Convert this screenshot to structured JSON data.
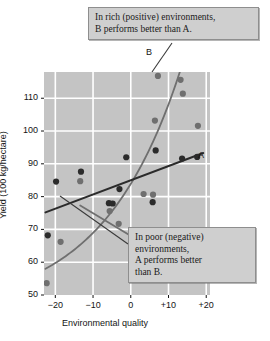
{
  "chart_data": {
    "type": "scatter",
    "title": "",
    "xlabel": "Environmental quality",
    "ylabel": "Yield (100 kg/hectare)",
    "xlim": [
      -23,
      21
    ],
    "ylim": [
      50,
      118
    ],
    "xticks": [
      "−20",
      "−10",
      "0",
      "+10",
      "+20"
    ],
    "xtickvalues": [
      -20,
      -10,
      0,
      10,
      20
    ],
    "yticks": [
      "50",
      "60",
      "70",
      "80",
      "90",
      "100",
      "110"
    ],
    "ytickvalues": [
      50,
      60,
      70,
      80,
      90,
      100,
      110
    ],
    "grid": true,
    "grid_color": "#ffffff",
    "plot_background": "#c4c4c4",
    "legend": "none",
    "series": [
      {
        "name": "A",
        "label": "A",
        "color": "#2b2b2b",
        "marker": "filled-circle",
        "line_type": "straight",
        "points": [
          {
            "x": -22.0,
            "y": 68.2
          },
          {
            "x": -19.8,
            "y": 84.6
          },
          {
            "x": -13.2,
            "y": 87.6
          },
          {
            "x": -5.8,
            "y": 78.0
          },
          {
            "x": -4.8,
            "y": 77.9
          },
          {
            "x": -3.0,
            "y": 82.3
          },
          {
            "x": -1.2,
            "y": 92.0
          },
          {
            "x": 5.8,
            "y": 78.3
          },
          {
            "x": 6.6,
            "y": 94.1
          },
          {
            "x": 13.6,
            "y": 91.6
          },
          {
            "x": 17.6,
            "y": 92.1
          }
        ],
        "fit_line": {
          "x_start": -22.6,
          "y_start": 75.2,
          "x_end": 19.2,
          "y_end": 93.3
        }
      },
      {
        "name": "B",
        "label": "B",
        "color": "#6f6f6f",
        "marker": "filled-circle",
        "line_type": "exponential-curve",
        "points": [
          {
            "x": -22.3,
            "y": 53.6
          },
          {
            "x": -18.6,
            "y": 66.2
          },
          {
            "x": -13.4,
            "y": 84.7
          },
          {
            "x": -5.6,
            "y": 75.6
          },
          {
            "x": -3.2,
            "y": 71.7
          },
          {
            "x": 3.4,
            "y": 80.8
          },
          {
            "x": 5.9,
            "y": 80.6
          },
          {
            "x": 6.4,
            "y": 103.2
          },
          {
            "x": 7.2,
            "y": 116.8
          },
          {
            "x": 13.2,
            "y": 115.6
          },
          {
            "x": 13.8,
            "y": 111.4
          },
          {
            "x": 17.8,
            "y": 101.6
          }
        ],
        "fit_curve": {
          "x_start": -22.6,
          "y_start": 58.0,
          "x_end": 13.0,
          "y_end": 118.0
        }
      }
    ],
    "extra_line": {
      "name": "crossover-line",
      "color": "#6f6f6f",
      "x_start": -13.4,
      "y_start": 77.3,
      "x_end": 8.0,
      "y_end": 62.5
    },
    "annotations": [
      {
        "id": "rich",
        "lines": [
          "In rich (positive) environments,",
          "B performs better than A."
        ],
        "leader_from": {
          "x": 172,
          "y": 43
        },
        "leader_to": {
          "x": 152,
          "y": 72
        }
      },
      {
        "id": "poor",
        "lines": [
          "In poor (negative)",
          "environments,",
          "A performs better",
          "than B."
        ],
        "leader_from": {
          "x": 128,
          "y": 244
        },
        "leader_to": {
          "x": 60,
          "y": 196
        }
      }
    ]
  },
  "annotations": {
    "rich": {
      "line1": "In rich (positive) environments,",
      "line2": "B performs better than A."
    },
    "poor": {
      "line1": "In poor (negative)",
      "line2": "environments,",
      "line3": "A performs better",
      "line4": "than B."
    }
  },
  "axes": {
    "x_title": "Environmental quality",
    "y_title": "Yield (100 kg/hectare)",
    "x_ticks": [
      "−20",
      "−10",
      "0",
      "+10",
      "+20"
    ],
    "y_ticks": [
      "110",
      "100",
      "90",
      "80",
      "70",
      "60",
      "50"
    ]
  },
  "curve_labels": {
    "a": "A",
    "b": "B"
  },
  "colors": {
    "plot_bg": "#c4c4c4",
    "grid": "#ffffff",
    "series_a": "#2b2b2b",
    "series_b": "#6f6f6f",
    "callout_bg": "#cfcfcf",
    "callout_border": "#8e8e8e",
    "text": "#141414"
  }
}
